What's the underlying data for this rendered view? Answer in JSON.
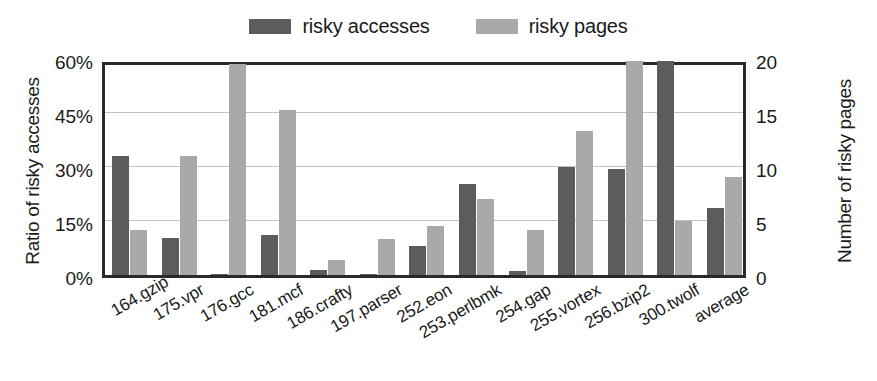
{
  "chart_data": {
    "type": "bar",
    "title": "",
    "xlabel": "",
    "ylabel": "Ratio of risky accesses",
    "y2label": "Number of risky pages",
    "grid": true,
    "legend_position": "top-center",
    "categories": [
      "164.gzip",
      "175.vpr",
      "176.gcc",
      "181.mcf",
      "186.crafty",
      "197.parser",
      "252.eon",
      "253.perlbmk",
      "254.gap",
      "255.vortex",
      "256.bzip2",
      "300.twolf",
      "average"
    ],
    "series": [
      {
        "name": "risky accesses",
        "axis": "left",
        "unit": "%",
        "color": "#5c5c5c",
        "values": [
          33.0,
          10.3,
          0.4,
          11.0,
          1.3,
          0.3,
          8.0,
          25.3,
          1.0,
          30.0,
          29.5,
          59.5,
          18.5
        ]
      },
      {
        "name": "risky pages",
        "axis": "right",
        "unit": "pages",
        "color": "#a9a9a9",
        "values": [
          4.2,
          11.0,
          19.5,
          15.3,
          1.4,
          3.3,
          4.5,
          7.0,
          4.2,
          13.3,
          19.8,
          5.0,
          9.1
        ]
      }
    ],
    "ylim": [
      0,
      60
    ],
    "y2lim": [
      0,
      20
    ],
    "yticks": [
      0,
      15,
      30,
      45,
      60
    ],
    "y2ticks": [
      0,
      5,
      10,
      15,
      20
    ],
    "ytick_labels": [
      "0%",
      "15%",
      "30%",
      "45%",
      "60%"
    ],
    "y2tick_labels": [
      "0",
      "5",
      "10",
      "15",
      "20"
    ]
  },
  "legend": {
    "entries": [
      {
        "label": "risky accesses",
        "color": "#5c5c5c"
      },
      {
        "label": "risky pages",
        "color": "#a9a9a9"
      }
    ]
  }
}
